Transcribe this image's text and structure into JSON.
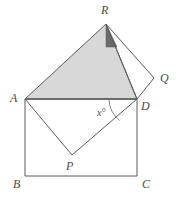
{
  "figure": {
    "background_color": "#ffffff",
    "stroke_color": "#5a5a5a",
    "shaded_fill": "#d8d8d8",
    "dark_fill": "#6a6a6a",
    "stroke_width": 1
  },
  "labels": {
    "A": "A",
    "B": "B",
    "C": "C",
    "D": "D",
    "P": "P",
    "Q": "Q",
    "R": "R",
    "angle": "x°"
  },
  "points": {
    "A": {
      "x": 25,
      "y": 99
    },
    "B": {
      "x": 25,
      "y": 176
    },
    "C": {
      "x": 137,
      "y": 176
    },
    "D": {
      "x": 137,
      "y": 99
    },
    "P": {
      "x": 72,
      "y": 155
    },
    "Q": {
      "x": 154,
      "y": 78
    },
    "R": {
      "x": 106,
      "y": 24
    },
    "K": {
      "x": 117,
      "y": 47
    }
  },
  "label_positions": {
    "A": {
      "x": 10,
      "y": 92
    },
    "B": {
      "x": 13,
      "y": 178
    },
    "C": {
      "x": 142,
      "y": 178
    },
    "D": {
      "x": 141,
      "y": 100
    },
    "P": {
      "x": 66,
      "y": 160
    },
    "Q": {
      "x": 160,
      "y": 72
    },
    "R": {
      "x": 101,
      "y": 4
    },
    "angle": {
      "x": 97,
      "y": 108
    }
  },
  "shapes": {
    "rectangle_ABCD": [
      "A",
      "B",
      "C",
      "D"
    ],
    "square_APDQ_lower": [
      "A",
      "P",
      "D"
    ],
    "triangle_ARD_shaded": [
      "A",
      "R",
      "D"
    ],
    "triangle_RQD": [
      "R",
      "Q",
      "D"
    ],
    "triangle_dark_RKD": [
      "R",
      "K",
      "D"
    ]
  },
  "angle_arc": {
    "vertex": "D",
    "radius": 28,
    "start_deg": 180,
    "end_deg": 232
  }
}
